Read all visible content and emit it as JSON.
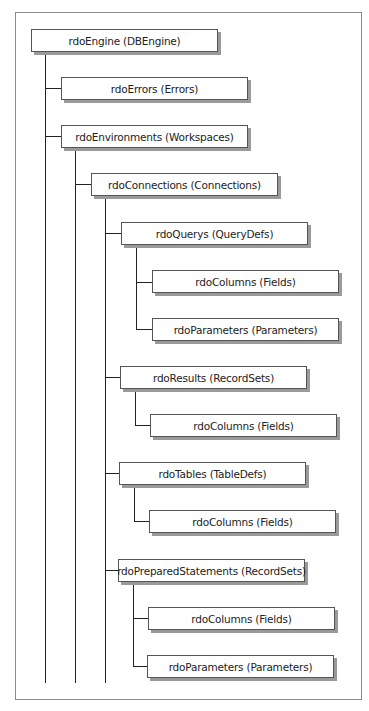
{
  "diagram": {
    "type": "object-hierarchy",
    "nodes": [
      {
        "id": "engine",
        "label": "rdoEngine (DBEngine)",
        "level": 0
      },
      {
        "id": "errors",
        "label": "rdoErrors (Errors)",
        "level": 1,
        "parent": "engine"
      },
      {
        "id": "environments",
        "label": "rdoEnvironments (Workspaces)",
        "level": 1,
        "parent": "engine"
      },
      {
        "id": "connections",
        "label": "rdoConnections (Connections)",
        "level": 2,
        "parent": "environments"
      },
      {
        "id": "querys",
        "label": "rdoQuerys (QueryDefs)",
        "level": 3,
        "parent": "connections"
      },
      {
        "id": "querys_columns",
        "label": "rdoColumns (Fields)",
        "level": 4,
        "parent": "querys"
      },
      {
        "id": "querys_parameters",
        "label": "rdoParameters (Parameters)",
        "level": 4,
        "parent": "querys"
      },
      {
        "id": "results",
        "label": "rdoResults (RecordSets)",
        "level": 3,
        "parent": "connections"
      },
      {
        "id": "results_columns",
        "label": "rdoColumns (Fields)",
        "level": 4,
        "parent": "results"
      },
      {
        "id": "tables",
        "label": "rdoTables (TableDefs)",
        "level": 3,
        "parent": "connections"
      },
      {
        "id": "tables_columns",
        "label": "rdoColumns (Fields)",
        "level": 4,
        "parent": "tables"
      },
      {
        "id": "prepared",
        "label": "rdoPreparedStatements (RecordSets)",
        "level": 3,
        "parent": "connections"
      },
      {
        "id": "prepared_columns",
        "label": "rdoColumns (Fields)",
        "level": 4,
        "parent": "prepared"
      },
      {
        "id": "prepared_parameters",
        "label": "rdoParameters (Parameters)",
        "level": 4,
        "parent": "prepared"
      }
    ]
  }
}
